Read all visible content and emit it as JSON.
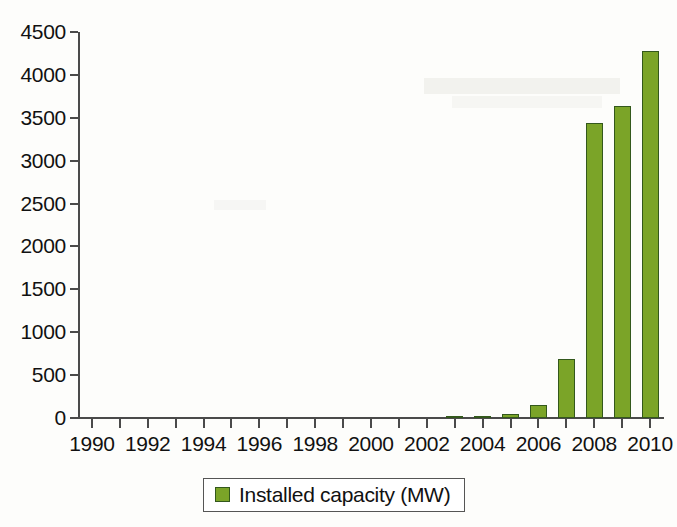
{
  "chart_data": {
    "type": "bar",
    "title": "",
    "xlabel": "",
    "ylabel": "",
    "ylim": [
      0,
      4500
    ],
    "ytick_step": 500,
    "grid": false,
    "legend_position": "bottom-center",
    "series": [
      {
        "name": "Installed capacity (MW)",
        "color": "#7ba428",
        "values": [
          0,
          0,
          0,
          0,
          0,
          0,
          0,
          0,
          0,
          0,
          0,
          0,
          0,
          10,
          15,
          50,
          150,
          690,
          3440,
          3640,
          4280
        ]
      }
    ],
    "categories": [
      "1990",
      "1991",
      "1992",
      "1993",
      "1994",
      "1995",
      "1996",
      "1997",
      "1998",
      "1999",
      "2000",
      "2001",
      "2002",
      "2003",
      "2004",
      "2005",
      "2006",
      "2007",
      "2008",
      "2009",
      "2010"
    ],
    "x_tick_labels": [
      {
        "category": "1990",
        "label": "1990"
      },
      {
        "category": "1991",
        "label": ""
      },
      {
        "category": "1992",
        "label": "1992"
      },
      {
        "category": "1993",
        "label": ""
      },
      {
        "category": "1994",
        "label": "1994"
      },
      {
        "category": "1995",
        "label": ""
      },
      {
        "category": "1996",
        "label": "1996"
      },
      {
        "category": "1997",
        "label": ""
      },
      {
        "category": "1998",
        "label": "1998"
      },
      {
        "category": "1999",
        "label": ""
      },
      {
        "category": "2000",
        "label": "2000"
      },
      {
        "category": "2001",
        "label": ""
      },
      {
        "category": "2002",
        "label": "2002"
      },
      {
        "category": "2003",
        "label": ""
      },
      {
        "category": "2004",
        "label": "2004"
      },
      {
        "category": "2005",
        "label": ""
      },
      {
        "category": "2006",
        "label": "2006"
      },
      {
        "category": "2007",
        "label": ""
      },
      {
        "category": "2008",
        "label": "2008"
      },
      {
        "category": "2009",
        "label": ""
      },
      {
        "category": "2010",
        "label": "2010"
      }
    ],
    "y_tick_labels": [
      "0",
      "500",
      "1000",
      "1500",
      "2000",
      "2500",
      "3000",
      "3500",
      "4000",
      "4500"
    ],
    "y_tick_values": [
      0,
      500,
      1000,
      1500,
      2000,
      2500,
      3000,
      3500,
      4000,
      4500
    ]
  },
  "legend": {
    "entries": [
      {
        "label": "Installed capacity (MW)",
        "swatch_color": "#7ba428"
      }
    ]
  },
  "colors": {
    "bar_fill": "#7ba428",
    "bar_border": "#33581c",
    "axis": "#4a4a4a",
    "text": "#111111",
    "background": "#fdfdfb"
  }
}
